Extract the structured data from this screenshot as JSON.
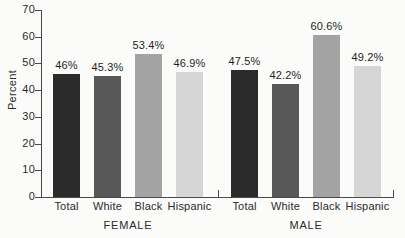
{
  "chart_data": {
    "type": "bar",
    "title": "",
    "xlabel": "",
    "ylabel": "Percent",
    "ylim": [
      0,
      70
    ],
    "yticks": [
      0,
      10,
      20,
      30,
      40,
      50,
      60,
      70
    ],
    "ytick_labels": [
      "0",
      "10",
      "20",
      "30",
      "40",
      "50",
      "60",
      "70"
    ],
    "grid": false,
    "legend": "none",
    "groups": [
      {
        "name": "FEMALE",
        "categories": [
          "Total",
          "White",
          "Black",
          "Hispanic"
        ],
        "values": [
          46,
          45.3,
          53.4,
          46.9
        ],
        "labels": [
          "46%",
          "45.3%",
          "53.4%",
          "46.9%"
        ],
        "colors": [
          "#2b2b2b",
          "#585858",
          "#a3a3a3",
          "#d6d6d6"
        ]
      },
      {
        "name": "MALE",
        "categories": [
          "Total",
          "White",
          "Black",
          "Hispanic"
        ],
        "values": [
          47.5,
          42.2,
          60.6,
          49.2
        ],
        "labels": [
          "47.5%",
          "42.2%",
          "60.6%",
          "49.2%"
        ],
        "colors": [
          "#2b2b2b",
          "#585858",
          "#a3a3a3",
          "#d6d6d6"
        ]
      }
    ]
  },
  "axis": {
    "y_title": "Percent"
  }
}
